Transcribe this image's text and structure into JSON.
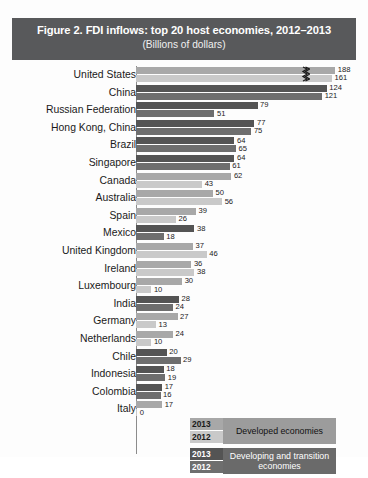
{
  "title": {
    "main": "Figure 2. FDI inflows: top 20 host economies, 2012–2013",
    "subtitle": "(Billions of dollars)"
  },
  "legend": {
    "developed": {
      "year_2013": "2013",
      "year_2012": "2012",
      "label": "Developed economies"
    },
    "developing": {
      "year_2013": "2013",
      "year_2012": "2012",
      "label": "Developing and transition economies"
    }
  },
  "colors": {
    "title_band": "#58595b",
    "developed_2013": "#a8a8a8",
    "developed_2012": "#c9c9c9",
    "developing_2013": "#545454",
    "developing_2012": "#6e6e6e",
    "background": "#fdfdfd"
  },
  "chart_data": {
    "type": "bar",
    "orientation": "horizontal",
    "title": "Figure 2. FDI inflows: top 20 host economies, 2012–2013",
    "subtitle": "(Billions of dollars)",
    "xlabel": "Billions of dollars",
    "ylabel": "",
    "xlim": [
      0,
      200
    ],
    "grid": false,
    "legend_position": "inside-bottom-right",
    "axis_break": {
      "applies_to": "United States",
      "symbol": "zigzag"
    },
    "categories": [
      "United States",
      "China",
      "Russian Federation",
      "Hong Kong, China",
      "Brazil",
      "Singapore",
      "Canada",
      "Australia",
      "Spain",
      "Mexico",
      "United Kingdom",
      "Ireland",
      "Luxembourg",
      "India",
      "Germany",
      "Netherlands",
      "Chile",
      "Indonesia",
      "Colombia",
      "Italy"
    ],
    "group": [
      "developed",
      "developing",
      "developing",
      "developing",
      "developing",
      "developing",
      "developed",
      "developed",
      "developed",
      "developing",
      "developed",
      "developed",
      "developed",
      "developing",
      "developed",
      "developed",
      "developing",
      "developing",
      "developing",
      "developed"
    ],
    "series": [
      {
        "name": "2013",
        "values": [
          188,
          124,
          79,
          77,
          64,
          64,
          62,
          50,
          39,
          38,
          37,
          36,
          30,
          28,
          27,
          24,
          20,
          18,
          17,
          17
        ]
      },
      {
        "name": "2012",
        "values": [
          161,
          121,
          51,
          75,
          65,
          61,
          43,
          56,
          26,
          18,
          46,
          38,
          10,
          24,
          13,
          10,
          29,
          19,
          16,
          0
        ]
      }
    ]
  }
}
